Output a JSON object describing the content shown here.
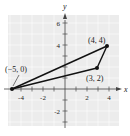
{
  "figure": {
    "type": "coordinate-plane-triangle",
    "background_color": "#ececec",
    "line_color": "#111111",
    "axes": {
      "x_label": "x",
      "y_label": "y",
      "x_range": [
        -5,
        5
      ],
      "y_range": [
        -3,
        7
      ],
      "x_ticks": [
        {
          "value": -4,
          "label": "-4"
        },
        {
          "value": -2,
          "label": "-2"
        },
        {
          "value": 2,
          "label": "2"
        },
        {
          "value": 4,
          "label": "4"
        }
      ],
      "y_ticks": [
        {
          "value": 6,
          "label": "6"
        },
        {
          "value": 4,
          "label": "4"
        },
        {
          "value": -2,
          "label": "-2"
        }
      ]
    },
    "points": [
      {
        "name": "A",
        "x": -5,
        "y": 0,
        "label": "(−5, 0)"
      },
      {
        "name": "B",
        "x": 4,
        "y": 4,
        "label": "(4, 4)"
      },
      {
        "name": "C",
        "x": 3,
        "y": 2,
        "label": "(3, 2)"
      }
    ],
    "segments": [
      {
        "from": "A",
        "to": "B"
      },
      {
        "from": "B",
        "to": "C"
      },
      {
        "from": "C",
        "to": "A"
      }
    ]
  }
}
